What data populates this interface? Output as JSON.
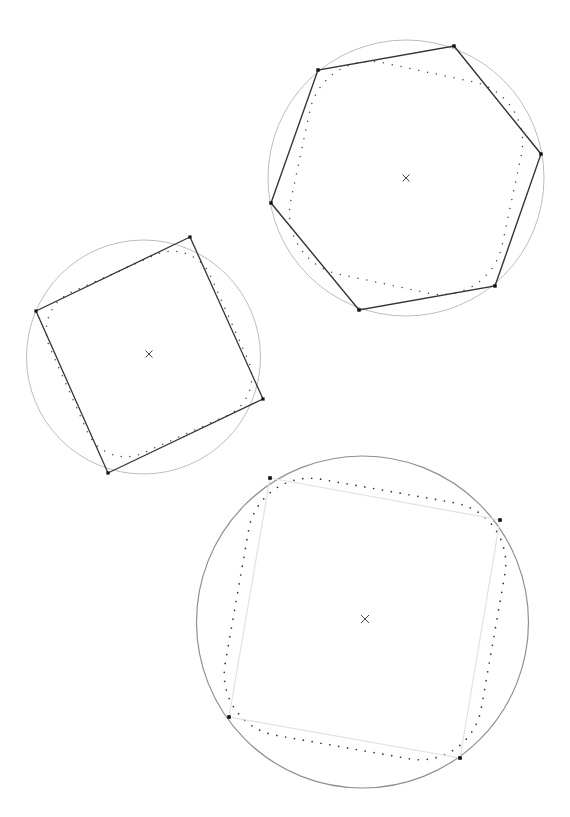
{
  "page": {
    "width": 570,
    "height": 817,
    "background": "#ffffff",
    "header_clipped_text": "",
    "caption": ""
  },
  "palette": {
    "circle_light": "#bdbdbd",
    "circle_mid": "#9a9a9a",
    "circle_dark": "#7d7d7d",
    "polygon_dark": "#333333",
    "polygon_light": "#e2e2e2",
    "vertex_marker": "#111111",
    "dotted_curve": "#444444",
    "center_marker": "#333333"
  },
  "chart_data": {
    "type": "diagram",
    "units": "pixels",
    "figures": [
      {
        "id": "figure-square",
        "name": "square-in-circle",
        "label": "Square inscribed in circle (upper left)",
        "center": [
          143.5,
          357.0
        ],
        "center_marker": {
          "x": 149,
          "y": 354,
          "glyph": "x",
          "size": 7
        },
        "circle": {
          "cx": 143.5,
          "cy": 357.0,
          "r": 117,
          "stroke": "#bdbdbd",
          "stroke_width": 1.0
        },
        "polygon": {
          "sides": 4,
          "stroke": "#333333",
          "stroke_width": 1.3,
          "vertices": [
            [
              190,
              237
            ],
            [
              263,
              399
            ],
            [
              108,
              473
            ],
            [
              36,
              311
            ]
          ],
          "vertex_markers": true,
          "vertex_marker_size": 3.2
        },
        "inner_curve": {
          "style": "dotted",
          "shape": "rounded-square",
          "cx": 149,
          "cy": 354,
          "half_size": 88,
          "corner_radius": 42,
          "rotation_deg": -24,
          "dot_radius": 0.75,
          "dot_count": 72,
          "color": "#444444"
        }
      },
      {
        "id": "figure-hexagon",
        "name": "hexagon-in-circle",
        "label": "Hexagon inscribed in circle (upper right)",
        "center": [
          406.0,
          178.0
        ],
        "center_marker": {
          "x": 406,
          "y": 178,
          "glyph": "x",
          "size": 7
        },
        "circle": {
          "cx": 406.0,
          "cy": 178.0,
          "r": 138,
          "stroke": "#bdbdbd",
          "stroke_width": 1.0
        },
        "polygon": {
          "sides": 6,
          "stroke": "#333333",
          "stroke_width": 1.4,
          "vertices": [
            [
              454,
              46
            ],
            [
              541,
              154
            ],
            [
              495,
              286
            ],
            [
              359,
              310
            ],
            [
              271,
              203
            ],
            [
              318,
              70
            ]
          ],
          "vertex_markers": true,
          "vertex_marker_size": 3.4
        },
        "inner_curve": {
          "style": "dotted",
          "shape": "rounded-square",
          "cx": 406,
          "cy": 178,
          "half_size": 108,
          "corner_radius": 62,
          "rotation_deg": 12,
          "dot_radius": 0.75,
          "dot_count": 84,
          "color": "#444444"
        }
      },
      {
        "id": "figure-lightsquare",
        "name": "light-square-in-circle",
        "label": "Light square inscribed in circle (lower center)",
        "center": [
          362.5,
          622.0
        ],
        "center_marker": {
          "x": 365,
          "y": 619,
          "glyph": "x",
          "size": 8
        },
        "circle": {
          "cx": 362.5,
          "cy": 622.0,
          "r": 166,
          "stroke": "#8f8f8f",
          "stroke_width": 1.2
        },
        "polygon": {
          "sides": 4,
          "stroke": "#e2e2e2",
          "stroke_width": 1.2,
          "vertices": [
            [
              270,
              478
            ],
            [
              500,
              520
            ],
            [
              460,
              758
            ],
            [
              229,
              717
            ]
          ],
          "vertex_markers": true,
          "vertex_marker_size": 3.6
        },
        "inner_curve": {
          "style": "dotted",
          "shape": "rounded-square",
          "cx": 365,
          "cy": 619,
          "half_size": 130,
          "corner_radius": 62,
          "rotation_deg": 10,
          "dot_radius": 0.85,
          "dot_count": 104,
          "color": "#333333"
        }
      }
    ]
  }
}
